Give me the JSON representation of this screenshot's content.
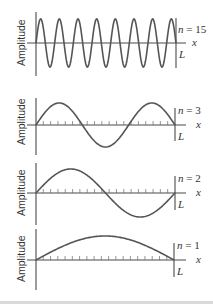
{
  "figure": {
    "y_axis_label": "Amplitude",
    "x_axis_label": "x",
    "length_label": "L",
    "colors": {
      "wave": "#555555",
      "axis": "#4a4a4a",
      "text": "#333333",
      "bottom_bar": "#d9d9d9"
    },
    "panels": [
      {
        "id": "n15",
        "n_label": "n = 15",
        "n": 15,
        "ticks": false
      },
      {
        "id": "n3",
        "n_label": "n = 3",
        "n": 3,
        "ticks": true,
        "tick_count": 19
      },
      {
        "id": "n2",
        "n_label": "n = 2",
        "n": 2,
        "ticks": true,
        "tick_count": 19
      },
      {
        "id": "n1",
        "n_label": "n = 1",
        "n": 1,
        "ticks": true,
        "tick_count": 19
      }
    ]
  },
  "chart_data": {
    "type": "line",
    "xlabel": "x",
    "ylabel": "Amplitude",
    "series": [
      {
        "name": "n = 15",
        "function": "sin(15*pi*x/L)",
        "half_wavelengths": 15
      },
      {
        "name": "n = 3",
        "function": "sin(3*pi*x/L)",
        "half_wavelengths": 3
      },
      {
        "name": "n = 2",
        "function": "sin(2*pi*x/L)",
        "half_wavelengths": 2
      },
      {
        "name": "n = 1",
        "function": "sin(pi*x/L)",
        "half_wavelengths": 1
      }
    ],
    "xlim": [
      "0",
      "L"
    ]
  }
}
